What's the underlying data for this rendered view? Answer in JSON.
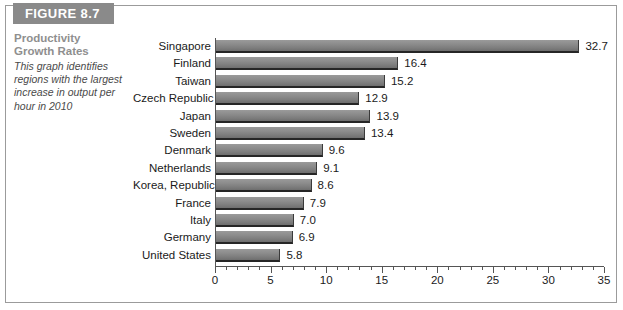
{
  "figure": {
    "banner_label": "FIGURE 8.7",
    "caption_title_line1": "Productivity",
    "caption_title_line2": "Growth Rates",
    "caption_body": "This graph identifies regions with the largest increase in output per hour in 2010",
    "accent_gray": "#8a8a8a",
    "bar_color": "#8c8c8c",
    "text_color": "#1a1a1a"
  },
  "chart_data": {
    "type": "bar",
    "orientation": "horizontal",
    "title": "Productivity Growth Rates",
    "xlabel": "",
    "ylabel": "",
    "xlim": [
      0,
      35
    ],
    "xticks": [
      0,
      5,
      10,
      15,
      20,
      25,
      30,
      35
    ],
    "xtick_labels": [
      "0",
      "5",
      "10",
      "15",
      "20",
      "25",
      "30",
      "35"
    ],
    "minor_tick_step": 1,
    "grid": false,
    "legend": false,
    "categories": [
      "Singapore",
      "Finland",
      "Taiwan",
      "Czech Republic",
      "Japan",
      "Sweden",
      "Denmark",
      "Netherlands",
      "Korea, Republic of",
      "France",
      "Italy",
      "Germany",
      "United States"
    ],
    "values": [
      32.7,
      16.4,
      15.2,
      12.9,
      13.9,
      13.4,
      9.6,
      9.1,
      8.6,
      7.9,
      7.0,
      6.9,
      5.8
    ],
    "value_labels": [
      "32.7",
      "16.4",
      "15.2",
      "12.9",
      "13.9",
      "13.4",
      "9.6",
      "9.1",
      "8.6",
      "7.9",
      "7.0",
      "6.9",
      "5.8"
    ]
  }
}
